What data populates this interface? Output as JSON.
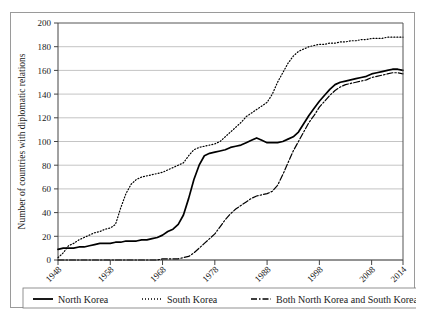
{
  "chart_data": {
    "type": "line",
    "title": "",
    "xlabel": "",
    "ylabel": "Number of countries with diplomatic relations",
    "xlim": [
      1948,
      2014
    ],
    "ylim": [
      0,
      200
    ],
    "grid": true,
    "grid_axis": "y",
    "legend_position": "bottom",
    "xticks": [
      "1948",
      "1958",
      "1968",
      "1978",
      "1988",
      "1998",
      "2008",
      "2014"
    ],
    "xtick_values": [
      1948,
      1958,
      1968,
      1978,
      1988,
      1998,
      2008,
      2014
    ],
    "yticks": [
      "0",
      "20",
      "40",
      "60",
      "80",
      "100",
      "120",
      "140",
      "160",
      "180",
      "200"
    ],
    "ytick_values": [
      0,
      20,
      40,
      60,
      80,
      100,
      120,
      140,
      160,
      180,
      200
    ],
    "series": [
      {
        "name": "North Korea",
        "style": "solid",
        "color": "#000000",
        "x": [
          1948,
          1949,
          1950,
          1951,
          1952,
          1953,
          1954,
          1955,
          1956,
          1957,
          1958,
          1959,
          1960,
          1961,
          1962,
          1963,
          1964,
          1965,
          1966,
          1967,
          1968,
          1969,
          1970,
          1971,
          1972,
          1973,
          1974,
          1975,
          1976,
          1977,
          1978,
          1979,
          1980,
          1981,
          1982,
          1983,
          1984,
          1985,
          1986,
          1987,
          1988,
          1989,
          1990,
          1991,
          1992,
          1993,
          1994,
          1995,
          1996,
          1997,
          1998,
          1999,
          2000,
          2001,
          2002,
          2003,
          2004,
          2005,
          2006,
          2007,
          2008,
          2009,
          2010,
          2011,
          2012,
          2013,
          2014
        ],
        "y": [
          9,
          10,
          10,
          10,
          11,
          11,
          12,
          13,
          14,
          14,
          14,
          15,
          15,
          16,
          16,
          16,
          17,
          17,
          18,
          19,
          21,
          24,
          26,
          30,
          38,
          52,
          68,
          80,
          88,
          90,
          91,
          92,
          93,
          95,
          96,
          97,
          99,
          101,
          103,
          101,
          99,
          99,
          99,
          100,
          102,
          104,
          108,
          115,
          122,
          128,
          134,
          139,
          144,
          148,
          150,
          151,
          152,
          153,
          154,
          155,
          157,
          158,
          159,
          160,
          161,
          161,
          160
        ]
      },
      {
        "name": "South Korea",
        "style": "dotted",
        "color": "#000000",
        "x": [
          1948,
          1949,
          1950,
          1951,
          1952,
          1953,
          1954,
          1955,
          1956,
          1957,
          1958,
          1959,
          1960,
          1961,
          1962,
          1963,
          1964,
          1965,
          1966,
          1967,
          1968,
          1969,
          1970,
          1971,
          1972,
          1973,
          1974,
          1975,
          1976,
          1977,
          1978,
          1979,
          1980,
          1981,
          1982,
          1983,
          1984,
          1985,
          1986,
          1987,
          1988,
          1989,
          1990,
          1991,
          1992,
          1993,
          1994,
          1995,
          1996,
          1997,
          1998,
          1999,
          2000,
          2001,
          2002,
          2003,
          2004,
          2005,
          2006,
          2007,
          2008,
          2009,
          2010,
          2011,
          2012,
          2013,
          2014
        ],
        "y": [
          2,
          6,
          12,
          14,
          17,
          19,
          21,
          23,
          24,
          26,
          27,
          30,
          44,
          56,
          64,
          68,
          70,
          71,
          72,
          73,
          74,
          76,
          78,
          80,
          82,
          88,
          93,
          95,
          96,
          97,
          98,
          100,
          104,
          108,
          112,
          116,
          121,
          124,
          127,
          130,
          133,
          140,
          150,
          158,
          166,
          172,
          176,
          178,
          180,
          181,
          182,
          182,
          183,
          183,
          184,
          184,
          185,
          185,
          186,
          186,
          187,
          187,
          187,
          188,
          188,
          188,
          188
        ]
      },
      {
        "name": "Both North Korea and South Korea",
        "style": "dashdot",
        "color": "#000000",
        "x": [
          1948,
          1949,
          1950,
          1951,
          1952,
          1953,
          1954,
          1955,
          1956,
          1957,
          1958,
          1959,
          1960,
          1961,
          1962,
          1963,
          1964,
          1965,
          1966,
          1967,
          1968,
          1969,
          1970,
          1971,
          1972,
          1973,
          1974,
          1975,
          1976,
          1977,
          1978,
          1979,
          1980,
          1981,
          1982,
          1983,
          1984,
          1985,
          1986,
          1987,
          1988,
          1989,
          1990,
          1991,
          1992,
          1993,
          1994,
          1995,
          1996,
          1997,
          1998,
          1999,
          2000,
          2001,
          2002,
          2003,
          2004,
          2005,
          2006,
          2007,
          2008,
          2009,
          2010,
          2011,
          2012,
          2013,
          2014
        ],
        "y": [
          0,
          0,
          0,
          0,
          0,
          0,
          0,
          0,
          0,
          0,
          0,
          0,
          0,
          0,
          0,
          0,
          0,
          0,
          0,
          0,
          1,
          1,
          1,
          1,
          2,
          3,
          6,
          10,
          14,
          18,
          22,
          28,
          34,
          39,
          43,
          46,
          49,
          52,
          54,
          55,
          56,
          58,
          63,
          72,
          82,
          92,
          100,
          108,
          116,
          122,
          129,
          134,
          139,
          143,
          146,
          148,
          149,
          150,
          151,
          152,
          154,
          155,
          156,
          157,
          158,
          158,
          157
        ]
      }
    ],
    "legend": [
      {
        "label": "North Korea",
        "style": "solid"
      },
      {
        "label": "South Korea",
        "style": "dotted"
      },
      {
        "label": "Both North Korea and South Korea",
        "style": "dashdot"
      }
    ]
  }
}
